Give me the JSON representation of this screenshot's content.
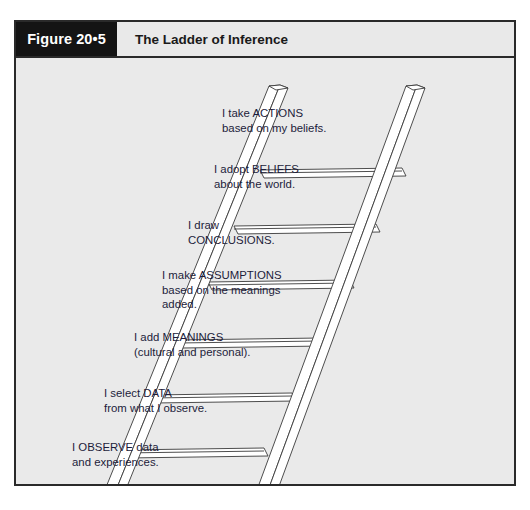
{
  "figure": {
    "number_label": "Figure 20•5",
    "title": "The Ladder of Inference"
  },
  "colors": {
    "frame_border": "#2a2a2a",
    "number_box_bg": "#141414",
    "number_box_text": "#ffffff",
    "header_bg": "#e9e9e9",
    "body_bg": "#eaeaea",
    "rail_fill": "#ffffff",
    "rail_stroke": "#3a3a3a",
    "rung_fill": "#ffffff",
    "rung_stroke": "#3a3a3a",
    "label_text": "#1c1c3a"
  },
  "diagram": {
    "type": "ladder",
    "orientation": "leaning-right",
    "rung_count": 7,
    "steps": [
      {
        "index": 7,
        "position": "top",
        "lines": [
          "I take ACTIONS",
          "based on my beliefs."
        ],
        "keyword": "ACTIONS"
      },
      {
        "index": 6,
        "lines": [
          "I adopt BELIEFS",
          "about the world."
        ],
        "keyword": "BELIEFS"
      },
      {
        "index": 5,
        "lines": [
          "I draw",
          "CONCLUSIONS."
        ],
        "keyword": "CONCLUSIONS"
      },
      {
        "index": 4,
        "lines": [
          "I make ASSUMPTIONS",
          "based on the meanings",
          "added."
        ],
        "keyword": "ASSUMPTIONS"
      },
      {
        "index": 3,
        "lines": [
          "I add MEANINGS",
          "(cultural and personal)."
        ],
        "keyword": "MEANINGS"
      },
      {
        "index": 2,
        "lines": [
          "I select DATA",
          "from what I observe."
        ],
        "keyword": "DATA"
      },
      {
        "index": 1,
        "position": "bottom",
        "lines": [
          "I OBSERVE data",
          "and experiences."
        ],
        "keyword": "OBSERVE"
      }
    ]
  }
}
